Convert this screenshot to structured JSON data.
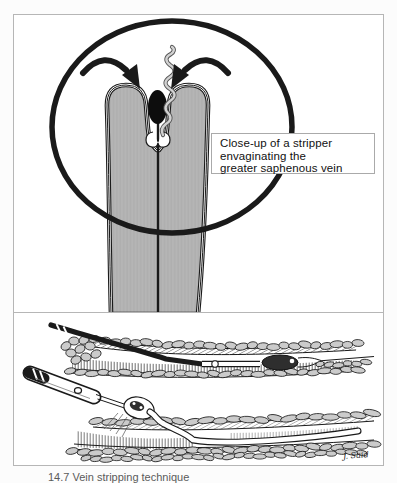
{
  "top_panel": {
    "label_lines": [
      "Close-up of a stripper",
      "envaginating the",
      "greater saphenous vein"
    ]
  },
  "bottom_panel": {
    "signature": "J. Said"
  },
  "caption_fragment": "14.7 Vein stripping technique",
  "colors": {
    "ink": "#1a1a1a",
    "vein_gray": "#b5b5b5",
    "lobule_gray": "#cbcbcb",
    "panel_border": "#b6b6b6",
    "label_border": "#aaaaaa",
    "background": "#fcfcfc"
  }
}
